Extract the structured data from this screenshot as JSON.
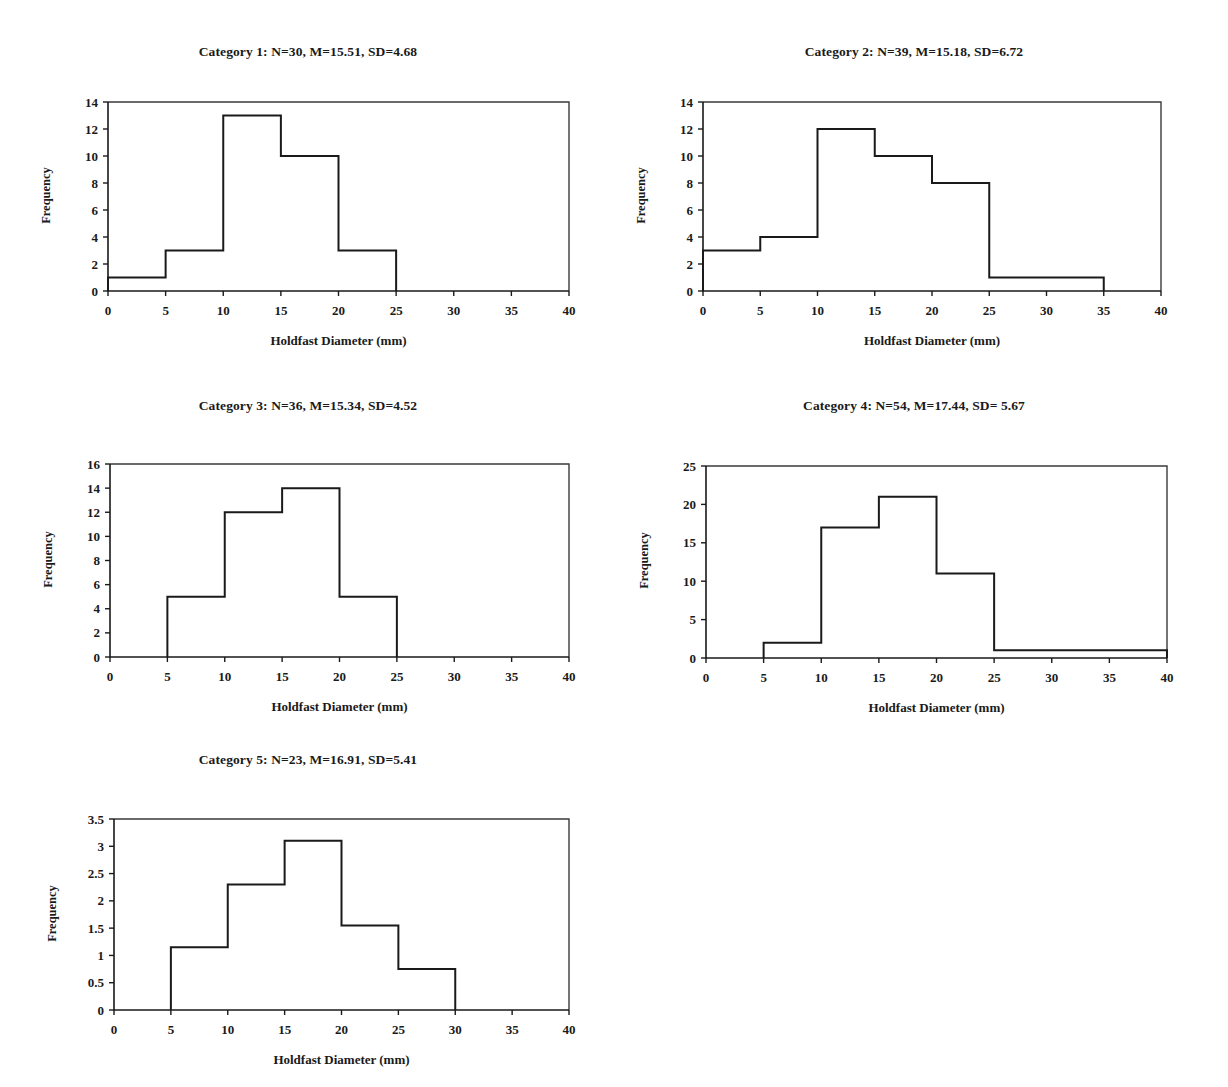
{
  "figure": {
    "shared_xlabel": "Holdfast Diameter (mm)",
    "shared_ylabel": "Frequency",
    "bin_edges": [
      0,
      5,
      10,
      15,
      20,
      25,
      30,
      35,
      40
    ]
  },
  "chart_data": [
    {
      "id": "category-1",
      "type": "bar",
      "title": "Category 1: N=30, M=15.51, SD=4.68",
      "xlabel": "Holdfast Diameter (mm)",
      "ylabel": "Frequency",
      "bin_edges": [
        0,
        5,
        10,
        15,
        20,
        25,
        30,
        35,
        40
      ],
      "categories": [
        "0-5",
        "5-10",
        "10-15",
        "15-20",
        "20-25",
        "25-30",
        "30-35",
        "35-40"
      ],
      "values": [
        1,
        3,
        13,
        10,
        3,
        0,
        0,
        0
      ],
      "xlim": [
        0,
        40
      ],
      "ylim": [
        0,
        14
      ],
      "xticks": [
        0,
        5,
        10,
        15,
        20,
        25,
        30,
        35,
        40
      ],
      "yticks": [
        0,
        2,
        4,
        6,
        8,
        10,
        12,
        14
      ],
      "xticklabels": [
        "0",
        "5",
        "10",
        "15",
        "20",
        "25",
        "30",
        "35",
        "40"
      ],
      "yticklabels": [
        "0",
        "2",
        "4",
        "6",
        "8",
        "10",
        "12",
        "14"
      ],
      "grid": false,
      "legend": "none",
      "stats": {
        "N": 30,
        "M": 15.51,
        "SD": 4.68
      }
    },
    {
      "id": "category-2",
      "type": "bar",
      "title": "Category 2: N=39, M=15.18, SD=6.72",
      "xlabel": "Holdfast Diameter (mm)",
      "ylabel": "Frequency",
      "bin_edges": [
        0,
        5,
        10,
        15,
        20,
        25,
        30,
        35,
        40
      ],
      "categories": [
        "0-5",
        "5-10",
        "10-15",
        "15-20",
        "20-25",
        "25-30",
        "30-35",
        "35-40"
      ],
      "values": [
        3,
        4,
        12,
        10,
        8,
        1,
        1,
        0
      ],
      "xlim": [
        0,
        40
      ],
      "ylim": [
        0,
        14
      ],
      "xticks": [
        0,
        5,
        10,
        15,
        20,
        25,
        30,
        35,
        40
      ],
      "yticks": [
        0,
        2,
        4,
        6,
        8,
        10,
        12,
        14
      ],
      "xticklabels": [
        "0",
        "5",
        "10",
        "15",
        "20",
        "25",
        "30",
        "35",
        "40"
      ],
      "yticklabels": [
        "0",
        "2",
        "4",
        "6",
        "8",
        "10",
        "12",
        "14"
      ],
      "grid": false,
      "legend": "none",
      "stats": {
        "N": 39,
        "M": 15.18,
        "SD": 6.72
      }
    },
    {
      "id": "category-3",
      "type": "bar",
      "title": "Category 3: N=36, M=15.34, SD=4.52",
      "xlabel": "Holdfast Diameter (mm)",
      "ylabel": "Frequency",
      "bin_edges": [
        0,
        5,
        10,
        15,
        20,
        25,
        30,
        35,
        40
      ],
      "categories": [
        "0-5",
        "5-10",
        "10-15",
        "15-20",
        "20-25",
        "25-30",
        "30-35",
        "35-40"
      ],
      "values": [
        0,
        5,
        12,
        14,
        5,
        0,
        0,
        0
      ],
      "xlim": [
        0,
        40
      ],
      "ylim": [
        0,
        16
      ],
      "xticks": [
        0,
        5,
        10,
        15,
        20,
        25,
        30,
        35,
        40
      ],
      "yticks": [
        0,
        2,
        4,
        6,
        8,
        10,
        12,
        14,
        16
      ],
      "xticklabels": [
        "0",
        "5",
        "10",
        "15",
        "20",
        "25",
        "30",
        "35",
        "40"
      ],
      "yticklabels": [
        "0",
        "2",
        "4",
        "6",
        "8",
        "10",
        "12",
        "14",
        "16"
      ],
      "grid": false,
      "legend": "none",
      "stats": {
        "N": 36,
        "M": 15.34,
        "SD": 4.52
      }
    },
    {
      "id": "category-4",
      "type": "bar",
      "title": "Category 4: N=54, M=17.44, SD= 5.67",
      "xlabel": "Holdfast Diameter (mm)",
      "ylabel": "Frequency",
      "bin_edges": [
        0,
        5,
        10,
        15,
        20,
        25,
        30,
        35,
        40
      ],
      "categories": [
        "0-5",
        "5-10",
        "10-15",
        "15-20",
        "20-25",
        "25-30",
        "30-35",
        "35-40"
      ],
      "values": [
        0,
        2,
        17,
        21,
        11,
        1,
        1,
        1
      ],
      "xlim": [
        0,
        40
      ],
      "ylim": [
        0,
        25
      ],
      "xticks": [
        0,
        5,
        10,
        15,
        20,
        25,
        30,
        35,
        40
      ],
      "yticks": [
        0,
        5,
        10,
        15,
        20,
        25
      ],
      "xticklabels": [
        "0",
        "5",
        "10",
        "15",
        "20",
        "25",
        "30",
        "35",
        "40"
      ],
      "yticklabels": [
        "0",
        "5",
        "10",
        "15",
        "20",
        "25"
      ],
      "grid": false,
      "legend": "none",
      "stats": {
        "N": 54,
        "M": 17.44,
        "SD": 5.67
      }
    },
    {
      "id": "category-5",
      "type": "bar",
      "title": "Category 5: N=23, M=16.91, SD=5.41",
      "xlabel": "Holdfast Diameter (mm)",
      "ylabel": "Frequency",
      "bin_edges": [
        0,
        5,
        10,
        15,
        20,
        25,
        30,
        35,
        40
      ],
      "categories": [
        "0-5",
        "5-10",
        "10-15",
        "15-20",
        "20-25",
        "25-30",
        "30-35",
        "35-40"
      ],
      "values": [
        0,
        1.15,
        2.3,
        3.1,
        1.55,
        0.75,
        0,
        0
      ],
      "xlim": [
        0,
        40
      ],
      "ylim": [
        0,
        3.5
      ],
      "xticks": [
        0,
        5,
        10,
        15,
        20,
        25,
        30,
        35,
        40
      ],
      "yticks": [
        0,
        0.5,
        1,
        1.5,
        2,
        2.5,
        3,
        3.5
      ],
      "xticklabels": [
        "0",
        "5",
        "10",
        "15",
        "20",
        "25",
        "30",
        "35",
        "40"
      ],
      "yticklabels": [
        "0",
        "0.5",
        "1",
        "1.5",
        "2",
        "2.5",
        "3",
        "3.5"
      ],
      "grid": false,
      "legend": "none",
      "stats": {
        "N": 23,
        "M": 16.91,
        "SD": 5.41
      }
    }
  ],
  "layout": [
    {
      "left": 8,
      "top": 44,
      "width": 600,
      "height": 330,
      "plot_x": 100,
      "plot_y": 58,
      "plot_w": 461,
      "plot_h": 189
    },
    {
      "left": 608,
      "top": 44,
      "width": 612,
      "height": 330,
      "plot_x": 95,
      "plot_y": 58,
      "plot_w": 458,
      "plot_h": 189
    },
    {
      "left": 8,
      "top": 398,
      "width": 600,
      "height": 340,
      "plot_x": 102,
      "plot_y": 66,
      "plot_w": 459,
      "plot_h": 193
    },
    {
      "left": 608,
      "top": 398,
      "width": 612,
      "height": 340,
      "plot_x": 98,
      "plot_y": 68,
      "plot_w": 461,
      "plot_h": 192
    },
    {
      "left": 8,
      "top": 752,
      "width": 600,
      "height": 335,
      "plot_x": 106,
      "plot_y": 67,
      "plot_w": 455,
      "plot_h": 191
    }
  ]
}
